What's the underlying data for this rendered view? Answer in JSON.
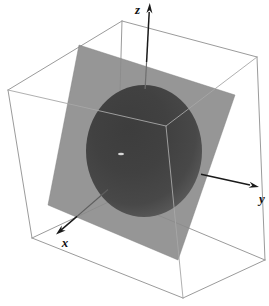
{
  "figure": {
    "axes": {
      "x_label": "x",
      "y_label": "y",
      "z_label": "z"
    },
    "colors": {
      "background": "#ffffff",
      "cube_edge": "#9b9b9b",
      "cube_edge_front": "#a8a8a8",
      "plane_fill": "#8b8b8b",
      "plane_edge": "#7f7f7f",
      "sphere_center": "#3d3d3d",
      "sphere_rim": "#6b6b6b",
      "axis_stroke": "#1a1a1a",
      "axis_through_plane": "#6e6e6e",
      "label_color": "#111111"
    }
  }
}
